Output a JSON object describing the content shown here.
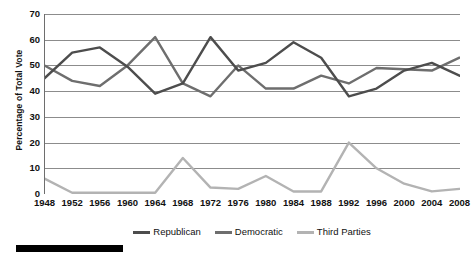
{
  "chart_data": {
    "type": "line",
    "title": "",
    "subtitle": "",
    "xlabel": "",
    "ylabel": "Percentage of Total Vote",
    "categories": [
      "1948",
      "1952",
      "1956",
      "1960",
      "1964",
      "1968",
      "1972",
      "1976",
      "1980",
      "1984",
      "1988",
      "1992",
      "1996",
      "2000",
      "2004",
      "2008"
    ],
    "x": [
      1948,
      1952,
      1956,
      1960,
      1964,
      1968,
      1972,
      1976,
      1980,
      1984,
      1988,
      1992,
      1996,
      2000,
      2004,
      2008
    ],
    "xlim": [
      1948,
      2008
    ],
    "ylim": [
      0,
      70
    ],
    "ytick_labels": [
      "0",
      "10",
      "20",
      "30",
      "40",
      "50",
      "60",
      "70"
    ],
    "yticks": [
      0,
      10,
      20,
      30,
      40,
      50,
      60,
      70
    ],
    "grid": "horizontal",
    "legend_position": "bottom-center",
    "series": [
      {
        "name": "Republican",
        "color": "#4d4d4d",
        "values": [
          45,
          55,
          57,
          49.5,
          39,
          43,
          61,
          48,
          51,
          59,
          53,
          38,
          41,
          48,
          51,
          46
        ]
      },
      {
        "name": "Democratic",
        "color": "#6e6e6e",
        "values": [
          50,
          44,
          42,
          50,
          61,
          43,
          38,
          50,
          41,
          41,
          46,
          43,
          49,
          48.5,
          48,
          53
        ]
      },
      {
        "name": "Third Parties",
        "color": "#b3b3b3",
        "values": [
          6,
          0.5,
          0.5,
          0.5,
          0.5,
          14,
          2.5,
          2,
          7,
          1,
          1,
          20,
          10,
          4,
          1,
          2
        ]
      }
    ]
  },
  "legend": {
    "entries": [
      {
        "label": "Republican"
      },
      {
        "label": "Democratic"
      },
      {
        "label": "Third Parties"
      }
    ]
  },
  "colors": {
    "republican": "#4d4d4d",
    "democratic": "#6e6e6e",
    "third_parties": "#b3b3b3",
    "grid": "#8c8c8c",
    "axis": "#6e6e6e",
    "rule": "#000000"
  }
}
